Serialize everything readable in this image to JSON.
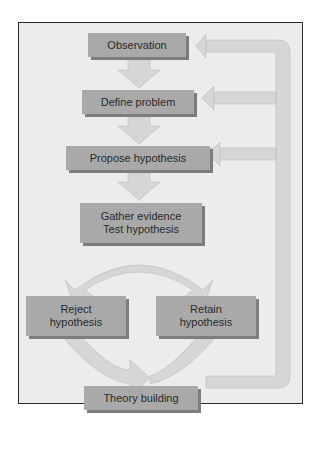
{
  "diagram": {
    "nodes": [
      {
        "id": "observation",
        "label": "Observation"
      },
      {
        "id": "define",
        "label": "Define problem"
      },
      {
        "id": "propose",
        "label": "Propose hypothesis"
      },
      {
        "id": "gather",
        "label": "Gather evidence\nTest  hypothesis"
      },
      {
        "id": "reject",
        "label": "Reject\nhypothesis"
      },
      {
        "id": "retain",
        "label": "Retain\nhypothesis"
      },
      {
        "id": "theory",
        "label": "Theory building"
      }
    ],
    "edges": [
      {
        "from": "observation",
        "to": "define"
      },
      {
        "from": "define",
        "to": "propose"
      },
      {
        "from": "propose",
        "to": "gather"
      },
      {
        "from": "gather",
        "to": "reject"
      },
      {
        "from": "gather",
        "to": "retain"
      },
      {
        "from": "reject",
        "to": "theory"
      },
      {
        "from": "retain",
        "to": "theory"
      },
      {
        "from": "theory",
        "to": "observation",
        "type": "feedback"
      },
      {
        "from": "theory",
        "to": "define",
        "type": "feedback"
      },
      {
        "from": "theory",
        "to": "propose",
        "type": "feedback"
      }
    ],
    "colors": {
      "box": "#a9a9a9",
      "box_shadow": "#7d7d7d",
      "arrow": "#d2d2d2",
      "background": "#ececec"
    }
  }
}
